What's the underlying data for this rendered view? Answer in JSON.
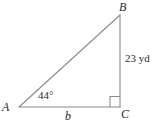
{
  "diagram": {
    "type": "right-triangle",
    "stroke_color": "#808080",
    "text_color": "#2b2b2b",
    "vertices": [
      {
        "name": "A",
        "label": "A",
        "x": 19,
        "y": 107
      },
      {
        "name": "B",
        "label": "B",
        "x": 120,
        "y": 15
      },
      {
        "name": "C",
        "label": "C",
        "x": 120,
        "y": 107
      }
    ],
    "sides": {
      "hypotenuse_AB": {
        "label": "",
        "from": "A",
        "to": "B"
      },
      "vertical_BC": {
        "label": "23 yd",
        "from": "B",
        "to": "C"
      },
      "base_AC": {
        "label": "b",
        "from": "A",
        "to": "C"
      }
    },
    "angles": {
      "at_A": {
        "label": "44°",
        "value": 44,
        "unit": "degrees"
      },
      "at_C": {
        "label": "",
        "value": 90,
        "unit": "degrees",
        "marker": "right-angle-square"
      }
    },
    "labels": {
      "vertex_a": "A",
      "vertex_b": "B",
      "vertex_c": "C",
      "base": "b",
      "height": "23 yd",
      "angle_a": "44°"
    }
  }
}
